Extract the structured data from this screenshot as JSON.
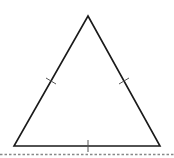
{
  "diagram": {
    "shape": "equilateral-triangle",
    "stroke_color": "#1a1a1a",
    "tick_color": "#555555",
    "baseline_color": "#888888",
    "vertices": {
      "apex": [
        88,
        16
      ],
      "bottom_left": [
        14,
        146
      ],
      "bottom_right": [
        160,
        146
      ]
    },
    "congruence_ticks": [
      {
        "side": "left",
        "count": 1
      },
      {
        "side": "right",
        "count": 1
      },
      {
        "side": "bottom",
        "count": 1
      }
    ],
    "baseline": {
      "style": "dashed",
      "y": 154
    }
  }
}
